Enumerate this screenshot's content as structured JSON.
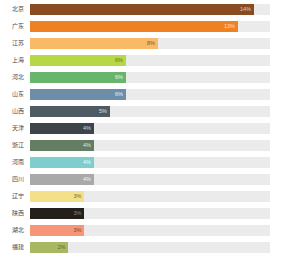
{
  "chart_data": {
    "type": "bar",
    "orientation": "horizontal",
    "title": "",
    "subtitle": "",
    "xlabel": "",
    "ylabel": "",
    "grid": false,
    "legend": null,
    "xlim": [
      0,
      15
    ],
    "value_suffix": "%",
    "track_color": "#ebebeb",
    "background": "#ffffff",
    "categories": [
      "北京",
      "广东",
      "江苏",
      "上海",
      "河北",
      "山东",
      "山西",
      "天津",
      "浙江",
      "河南",
      "四川",
      "辽宁",
      "陕西",
      "湖北",
      "福建"
    ],
    "values": [
      14,
      13,
      8,
      6,
      6,
      6,
      5,
      4,
      4,
      4,
      4,
      4,
      3,
      3,
      3
    ],
    "labels": [
      "14%",
      "13%",
      "8%",
      "6%",
      "6%",
      "6%",
      "5%",
      "4%",
      "4%",
      "4%",
      "4%",
      "4%",
      "3%",
      "3%",
      "3%"
    ],
    "colors": [
      "#8a4b20",
      "#ee8122",
      "#f9b967",
      "#b6d846",
      "#68b56d",
      "#6d8ea8",
      "#4e5b63",
      "#3d444a",
      "#647d63",
      "#7fcdcd",
      "#a9a9a9",
      "#f5e08a",
      "#231f1b",
      "#f79578",
      "#a8b761"
    ],
    "value_text_colors": [
      "#e9d9c8",
      "#ffe8d0",
      "#6b5030",
      "#5a6a22",
      "#ffffff",
      "#ffffff",
      "#ffffff",
      "#ffffff",
      "#ffffff",
      "#ffffff",
      "#ffffff",
      "#6b5f2a",
      "#8a8578",
      "#8a3f30",
      "#5d6630"
    ]
  },
  "rows": [
    {
      "label": "北京",
      "value_label": "14%",
      "pct": 14,
      "color": "#8a4b20",
      "text_color": "#e3cdb4"
    },
    {
      "label": "广东",
      "value_label": "13%",
      "pct": 13,
      "color": "#ee8122",
      "text_color": "#ffdfc0"
    },
    {
      "label": "江苏",
      "value_label": "8%",
      "pct": 8,
      "color": "#f9b967",
      "text_color": "#7a5a2e"
    },
    {
      "label": "上海",
      "value_label": "6%",
      "pct": 6,
      "color": "#b6d846",
      "text_color": "#5e7020"
    },
    {
      "label": "河北",
      "value_label": "6%",
      "pct": 6,
      "color": "#68b56d",
      "text_color": "#e8f5e8"
    },
    {
      "label": "山东",
      "value_label": "6%",
      "pct": 6,
      "color": "#6d8ea8",
      "text_color": "#e4eef5"
    },
    {
      "label": "山西",
      "value_label": "5%",
      "pct": 5,
      "color": "#4e5b63",
      "text_color": "#d8e0e4"
    },
    {
      "label": "天津",
      "value_label": "4%",
      "pct": 4,
      "color": "#3d444a",
      "text_color": "#d2d8dc"
    },
    {
      "label": "浙江",
      "value_label": "4%",
      "pct": 4,
      "color": "#647d63",
      "text_color": "#dfe8df"
    },
    {
      "label": "河南",
      "value_label": "4%",
      "pct": 4,
      "color": "#7fcdcd",
      "text_color": "#eafafa"
    },
    {
      "label": "四川",
      "value_label": "4%",
      "pct": 4,
      "color": "#a9a9a9",
      "text_color": "#f2f2f2"
    },
    {
      "label": "辽宁",
      "value_label": "3%",
      "pct": 3.4,
      "color": "#f5e08a",
      "text_color": "#7a6a2a"
    },
    {
      "label": "陕西",
      "value_label": "3%",
      "pct": 3.4,
      "color": "#231f1b",
      "text_color": "#8d8880"
    },
    {
      "label": "湖北",
      "value_label": "3%",
      "pct": 3.4,
      "color": "#f79578",
      "text_color": "#8f3e2a"
    },
    {
      "label": "福建",
      "value_label": "2%",
      "pct": 2.4,
      "color": "#a8b761",
      "text_color": "#5c6a28"
    }
  ]
}
